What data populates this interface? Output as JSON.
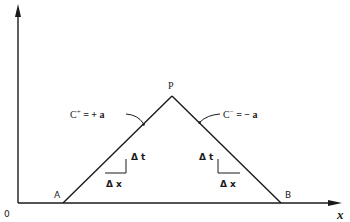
{
  "diagram": {
    "type": "characteristics-diagram",
    "axes": {
      "origin_label": "0",
      "x_label": "x",
      "y_label": ""
    },
    "points": {
      "A": {
        "label": "A"
      },
      "B": {
        "label": "B"
      },
      "P": {
        "label": "P"
      }
    },
    "characteristics": {
      "positive": {
        "label_main": "C",
        "label_sup": "+",
        "label_rest": " =  + a"
      },
      "negative": {
        "label_main": "C",
        "label_sup": "−",
        "label_rest": " =  − a"
      }
    },
    "slope_triangles": {
      "left": {
        "dt": "Δ t",
        "dx": "Δ x"
      },
      "right": {
        "dt": "Δ t",
        "dx": "Δ x"
      }
    },
    "colors": {
      "ink": "#1a1a1a",
      "background": "#ffffff"
    }
  }
}
